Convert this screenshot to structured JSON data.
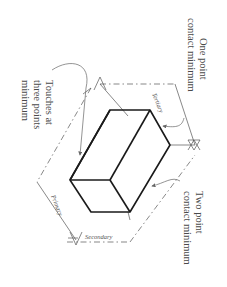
{
  "diagram": {
    "type": "datum reference frame illustration",
    "orientation": "rotated 90 degrees clockwise",
    "callouts": {
      "one_point": [
        "One point",
        "contact minimum"
      ],
      "two_point": [
        "Two point",
        "contact minimum"
      ],
      "three_points": [
        "Touches at",
        "three points",
        "minimum"
      ]
    },
    "planes": {
      "tertiary": "Tertiary",
      "primary": "Primary",
      "secondary": "Secondary"
    },
    "colors": {
      "part_outline": "#1a1a1a",
      "plane_lines": "#555555",
      "text": "#4a4a4a",
      "background": "#ffffff"
    }
  }
}
